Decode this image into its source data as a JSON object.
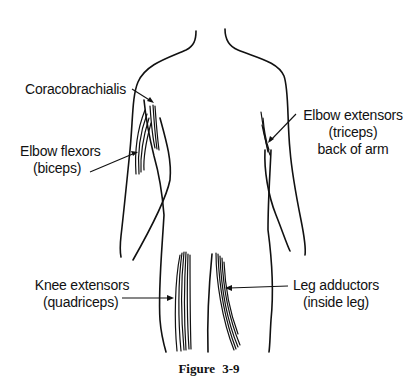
{
  "figure": {
    "caption": "Figure 3-9"
  },
  "labels": {
    "coracobrachialis": {
      "lines": [
        "Coracobrachialis"
      ]
    },
    "elbow_flexors": {
      "lines": [
        "Elbow flexors",
        "(biceps)"
      ]
    },
    "elbow_extensors": {
      "lines": [
        "Elbow extensors",
        "(triceps)",
        "back of arm"
      ]
    },
    "knee_extensors": {
      "lines": [
        "Knee extensors",
        "(quadriceps)"
      ]
    },
    "leg_adductors": {
      "lines": [
        "Leg adductors",
        "(inside leg)"
      ]
    }
  },
  "colors": {
    "ink": "#111111",
    "background": "#ffffff"
  }
}
